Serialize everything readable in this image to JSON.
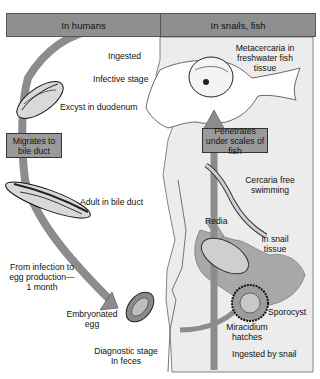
{
  "headers": {
    "left": "In humans",
    "right": "In snails, fish"
  },
  "human_stages": {
    "ingested": "Ingested",
    "infective_stage": "Infective stage",
    "excyst": "Excyst in duodenum",
    "migrates_box": "Migrates to bile duct",
    "adult": "Adult in bile duct",
    "timing": "From infection to egg production— 1 month",
    "embryonated_egg": "Embryonated egg",
    "diagnostic_stage": "Diagnostic stage In feces"
  },
  "snail_fish_stages": {
    "metacercaria": "Metacercaria in freshwater fish tissue",
    "penetrates_box": "Penetrates under scales of fish",
    "cercaria": "Cercaria free swimming",
    "redia": "Redia",
    "in_snail_tissue": "In snail tissue",
    "sporocyst": "Sporocyst",
    "miracidium": "Miracidium hatches",
    "ingested_by_snail": "Ingested by snail"
  },
  "colors": {
    "header_fill": "#8f8f8f",
    "panel_fill": "#ececec",
    "arrow_fill": "#8c8c8c",
    "box_fill": "#9a9a9a",
    "snail_fill": "#a8a8a8"
  }
}
